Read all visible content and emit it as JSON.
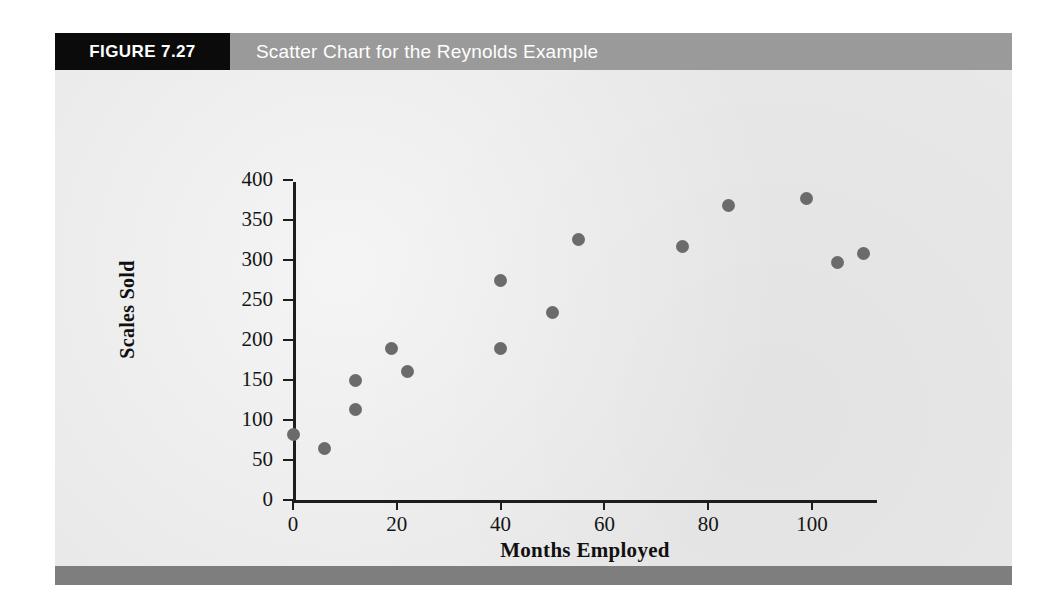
{
  "figure": {
    "number_label": "FIGURE 7.27",
    "title": "Scatter Chart for the Reynolds Example",
    "header_bg": "#9a9a9a",
    "number_box_bg": "#0b0b0b",
    "panel_bg": "#e8e8e8",
    "footer_bg": "#7e7e7e"
  },
  "chart_data": {
    "type": "scatter",
    "title": "Scatter Chart for the Reynolds Example",
    "xlabel": "Months Employed",
    "ylabel": "Scales Sold",
    "xlim": [
      0,
      112
    ],
    "ylim": [
      0,
      400
    ],
    "xticks": [
      0,
      20,
      40,
      60,
      80,
      100
    ],
    "yticks": [
      0,
      50,
      100,
      150,
      200,
      250,
      300,
      350,
      400
    ],
    "grid": false,
    "legend": null,
    "marker_color": "#6b6b6b",
    "marker_shape": "circle",
    "x": [
      0,
      6,
      12,
      12,
      19,
      22,
      40,
      40,
      50,
      55,
      75,
      84,
      99,
      105,
      110
    ],
    "y": [
      82,
      65,
      150,
      113,
      189,
      161,
      275,
      189,
      235,
      326,
      317,
      368,
      377,
      297,
      308
    ],
    "points": [
      {
        "x": 0,
        "y": 82
      },
      {
        "x": 6,
        "y": 65
      },
      {
        "x": 12,
        "y": 150
      },
      {
        "x": 12,
        "y": 113
      },
      {
        "x": 19,
        "y": 189
      },
      {
        "x": 22,
        "y": 161
      },
      {
        "x": 40,
        "y": 275
      },
      {
        "x": 40,
        "y": 189
      },
      {
        "x": 50,
        "y": 235
      },
      {
        "x": 55,
        "y": 326
      },
      {
        "x": 75,
        "y": 317
      },
      {
        "x": 84,
        "y": 368
      },
      {
        "x": 99,
        "y": 377
      },
      {
        "x": 105,
        "y": 297
      },
      {
        "x": 110,
        "y": 308
      }
    ]
  }
}
